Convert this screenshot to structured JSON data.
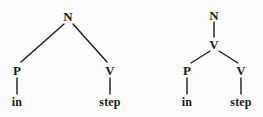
{
  "figure": {
    "type": "syntax-tree-pair",
    "background_color": "#fdfdfd",
    "ink_color": "#1c1c1c"
  },
  "trees": [
    {
      "id": "tree-left",
      "description": "Flat structure: N immediately dominates P and V",
      "nodes": [
        {
          "id": "l-n",
          "label": "N",
          "kind": "category",
          "x": 68,
          "y": 16
        },
        {
          "id": "l-p",
          "label": "P",
          "kind": "category",
          "x": 17,
          "y": 70
        },
        {
          "id": "l-v",
          "label": "V",
          "kind": "category",
          "x": 110,
          "y": 70
        },
        {
          "id": "l-in",
          "label": "in",
          "kind": "word",
          "x": 17,
          "y": 102
        },
        {
          "id": "l-step",
          "label": "step",
          "kind": "word",
          "x": 110,
          "y": 102
        }
      ],
      "edges": [
        {
          "from": "l-n",
          "to": "l-p",
          "x1": 64,
          "y1": 24,
          "x2": 21,
          "y2": 62
        },
        {
          "from": "l-n",
          "to": "l-v",
          "x1": 73,
          "y1": 24,
          "x2": 107,
          "y2": 62
        },
        {
          "from": "l-p",
          "to": "l-in",
          "x1": 17,
          "y1": 78,
          "x2": 17,
          "y2": 94
        },
        {
          "from": "l-v",
          "to": "l-step",
          "x1": 110,
          "y1": 78,
          "x2": 110,
          "y2": 94
        }
      ]
    },
    {
      "id": "tree-right",
      "description": "Layered structure: N dominates V, which dominates P and V",
      "nodes": [
        {
          "id": "r-n",
          "label": "N",
          "kind": "category",
          "x": 214,
          "y": 15
        },
        {
          "id": "r-v1",
          "label": "V",
          "kind": "category",
          "x": 214,
          "y": 44
        },
        {
          "id": "r-p",
          "label": "P",
          "kind": "category",
          "x": 187,
          "y": 70
        },
        {
          "id": "r-v2",
          "label": "V",
          "kind": "category",
          "x": 241,
          "y": 70
        },
        {
          "id": "r-in",
          "label": "in",
          "kind": "word",
          "x": 187,
          "y": 102
        },
        {
          "id": "r-step",
          "label": "step",
          "kind": "word",
          "x": 241,
          "y": 102
        }
      ],
      "edges": [
        {
          "from": "r-n",
          "to": "r-v1",
          "x1": 214,
          "y1": 22,
          "x2": 214,
          "y2": 37
        },
        {
          "from": "r-v1",
          "to": "r-p",
          "x1": 210,
          "y1": 51,
          "x2": 191,
          "y2": 63
        },
        {
          "from": "r-v1",
          "to": "r-v2",
          "x1": 219,
          "y1": 51,
          "x2": 238,
          "y2": 63
        },
        {
          "from": "r-p",
          "to": "r-in",
          "x1": 187,
          "y1": 78,
          "x2": 187,
          "y2": 94
        },
        {
          "from": "r-v2",
          "to": "r-step",
          "x1": 241,
          "y1": 78,
          "x2": 241,
          "y2": 94
        }
      ]
    }
  ]
}
